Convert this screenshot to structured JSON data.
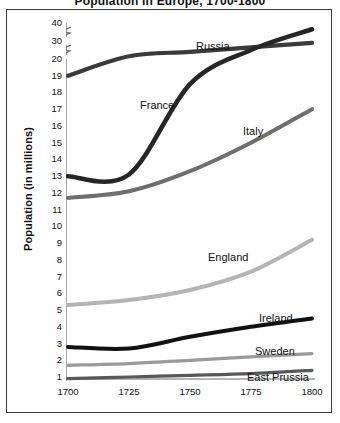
{
  "figure": {
    "partial_title": "Population in Europe, 1700-1800",
    "ylabel": "Population (in millions)"
  },
  "axis": {
    "y_ticks": [
      "40",
      "30",
      "20",
      "19",
      "18",
      "17",
      "16",
      "15",
      "14",
      "13",
      "12",
      "11",
      "10",
      "9",
      "8",
      "7",
      "6",
      "5",
      "4",
      "3",
      "2",
      "1"
    ],
    "x_ticks": [
      "1700",
      "1725",
      "1750",
      "1775",
      "1800"
    ],
    "y_break_marks": 2
  },
  "series_labels": {
    "russia": "Russia",
    "france": "France",
    "italy": "Italy",
    "england": "England",
    "ireland": "Ireland",
    "sweden": "Sweden",
    "east_prussia": "East Prussia"
  },
  "colors": {
    "russia": "#3a3a3a",
    "france": "#262626",
    "italy": "#6e6e6e",
    "england": "#b4b4b4",
    "ireland": "#111111",
    "sweden": "#9a9a9a",
    "east_prussia": "#585858",
    "frame": "#3a3a3a",
    "axis": "#6a6a6a",
    "background": "#ffffff"
  },
  "chart_data": {
    "type": "line",
    "title": "Population in Europe, 1700-1800",
    "xlabel": "",
    "ylabel": "Population (in millions)",
    "xlim": [
      1700,
      1800
    ],
    "ylim": [
      0,
      40
    ],
    "y_axis_note": "Axis broken between 20 and 30 and between 30 and 40; ticks 1-20 linear then compressed",
    "grid": false,
    "legend": "inline-labels",
    "x": [
      1700,
      1725,
      1750,
      1775,
      1800
    ],
    "series": [
      {
        "name": "Russia",
        "values": [
          19.0,
          21.5,
          24.0,
          26.5,
          29.0
        ]
      },
      {
        "name": "France",
        "values": [
          13.0,
          13.1,
          18.5,
          25.0,
          36.5
        ]
      },
      {
        "name": "Italy",
        "values": [
          11.7,
          12.1,
          13.3,
          15.0,
          17.0
        ]
      },
      {
        "name": "England",
        "values": [
          5.3,
          5.6,
          6.2,
          7.3,
          9.2
        ]
      },
      {
        "name": "Ireland",
        "values": [
          2.8,
          2.7,
          3.4,
          4.0,
          4.5
        ]
      },
      {
        "name": "Sweden",
        "values": [
          1.7,
          1.8,
          2.0,
          2.2,
          2.4
        ]
      },
      {
        "name": "East Prussia",
        "values": [
          0.9,
          1.0,
          1.1,
          1.2,
          1.4
        ]
      }
    ]
  }
}
